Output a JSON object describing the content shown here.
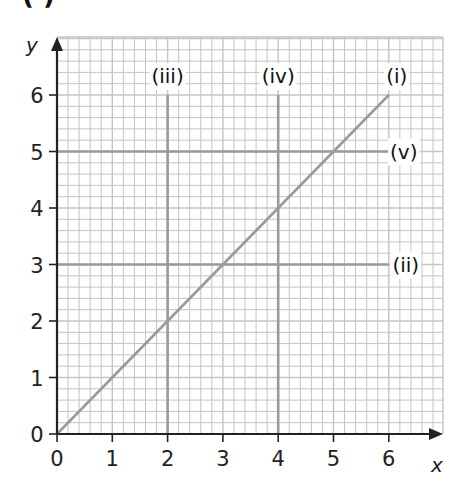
{
  "chart_data": {
    "type": "line",
    "title": "",
    "clipped_heading": "( )",
    "xlabel": "x",
    "ylabel": "y",
    "xlim": [
      0,
      6
    ],
    "ylim": [
      0,
      6
    ],
    "x_ticks": [
      "0",
      "1",
      "2",
      "3",
      "4",
      "5",
      "6"
    ],
    "y_ticks": [
      "0",
      "1",
      "2",
      "3",
      "4",
      "5",
      "6"
    ],
    "grid": true,
    "grid_minor_per_unit": 5,
    "series": [
      {
        "name": "(i)",
        "equation": "y = x",
        "points": [
          [
            0,
            0
          ],
          [
            6,
            6
          ]
        ]
      },
      {
        "name": "(ii)",
        "equation": "y = 3",
        "points": [
          [
            0,
            3
          ],
          [
            6,
            3
          ]
        ]
      },
      {
        "name": "(iii)",
        "equation": "x = 2",
        "points": [
          [
            2,
            0
          ],
          [
            2,
            6
          ]
        ]
      },
      {
        "name": "(iv)",
        "equation": "x = 4",
        "points": [
          [
            4,
            0
          ],
          [
            4,
            6
          ]
        ]
      },
      {
        "name": "(v)",
        "equation": "y = 5",
        "points": [
          [
            0,
            5
          ],
          [
            6,
            5
          ]
        ]
      }
    ],
    "colors": {
      "minor_grid": "#c4c4c4",
      "major_line": "#9a9a9a",
      "axis": "#222222"
    }
  }
}
